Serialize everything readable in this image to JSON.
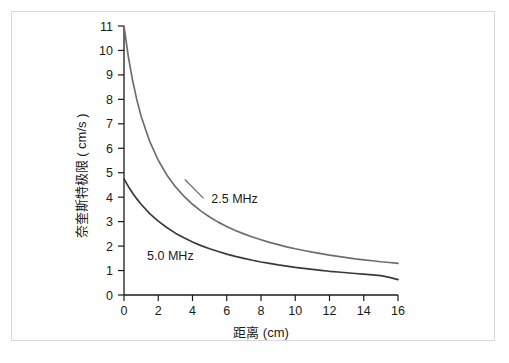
{
  "chart_data": {
    "type": "line",
    "title": "",
    "xlabel": "距离 (cm)",
    "ylabel": "奈奎斯特极限 ( cm/s )",
    "xlim": [
      0,
      16
    ],
    "ylim": [
      0,
      11
    ],
    "xticks": [
      "0",
      "2",
      "4",
      "6",
      "8",
      "10",
      "12",
      "14",
      "16"
    ],
    "xtick_values": [
      0,
      2,
      4,
      6,
      8,
      10,
      12,
      14,
      16
    ],
    "yticks": [
      "0",
      "1",
      "2",
      "3",
      "4",
      "5",
      "6",
      "7",
      "8",
      "9",
      "10",
      "11"
    ],
    "ytick_values": [
      0,
      1,
      2,
      3,
      4,
      5,
      6,
      7,
      8,
      9,
      10,
      11
    ],
    "grid": false,
    "legend_position": "inline-annotation",
    "series": [
      {
        "name": "2.5 MHz",
        "color": "#6e6e6e",
        "label_text": "2.5 MHz",
        "label_x": 5.1,
        "label_y": 3.75,
        "x": [
          0,
          0.25,
          0.5,
          0.75,
          1,
          1.5,
          2,
          2.5,
          3,
          3.5,
          4,
          4.5,
          5,
          5.5,
          6,
          6.5,
          7,
          7.5,
          8,
          8.5,
          9,
          9.5,
          10,
          10.5,
          11,
          11.5,
          12,
          12.5,
          13,
          13.5,
          14,
          14.5,
          15,
          15.5,
          16
        ],
        "y": [
          11.0,
          9.76,
          8.78,
          7.98,
          7.31,
          6.28,
          5.51,
          4.91,
          4.43,
          4.04,
          3.71,
          3.43,
          3.19,
          2.98,
          2.8,
          2.64,
          2.5,
          2.37,
          2.26,
          2.15,
          2.06,
          1.97,
          1.89,
          1.82,
          1.75,
          1.69,
          1.63,
          1.58,
          1.53,
          1.48,
          1.44,
          1.4,
          1.36,
          1.33,
          1.29
        ]
      },
      {
        "name": "5.0 MHz",
        "color": "#3a3a3a",
        "label_text": "5.0 MHz",
        "label_x": 1.35,
        "label_y": 1.42,
        "x": [
          0,
          0.25,
          0.5,
          0.75,
          1,
          1.5,
          2,
          2.5,
          3,
          3.5,
          4,
          4.5,
          5,
          5.5,
          6,
          6.5,
          7,
          7.5,
          8,
          8.5,
          9,
          9.5,
          10,
          10.5,
          11,
          11.5,
          12,
          12.5,
          13,
          13.5,
          14,
          14.5,
          15,
          15.5,
          16
        ],
        "y": [
          4.75,
          4.44,
          4.17,
          3.93,
          3.71,
          3.33,
          3.02,
          2.76,
          2.53,
          2.34,
          2.17,
          2.02,
          1.89,
          1.78,
          1.67,
          1.58,
          1.5,
          1.42,
          1.35,
          1.29,
          1.23,
          1.18,
          1.13,
          1.09,
          1.05,
          1.01,
          0.97,
          0.94,
          0.91,
          0.88,
          0.85,
          0.82,
          0.79,
          0.72,
          0.63
        ]
      }
    ],
    "annotations": [
      {
        "name": "leader-line-2.5mhz",
        "from_x": 3.55,
        "from_y": 4.72,
        "to_x": 4.65,
        "to_y": 3.95
      }
    ]
  },
  "axes": {
    "axis_color": "#1a1a1a",
    "frame_color": "#d8d8d8",
    "background": "#ffffff"
  }
}
